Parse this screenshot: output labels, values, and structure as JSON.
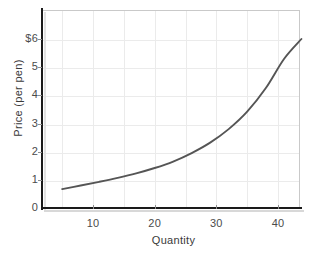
{
  "chart_data": {
    "type": "line",
    "title": "",
    "subtitle": "",
    "xlabel": "Quantity",
    "ylabel": "Price (per pen)",
    "xlim": [
      0,
      46
    ],
    "ylim": [
      0,
      6.6
    ],
    "grid": true,
    "legend": null,
    "legend_position": "none",
    "series": [
      {
        "name": "Supply curve",
        "color": "#555555",
        "x": [
          5,
          8,
          11,
          14,
          17,
          20,
          23,
          26,
          29,
          32,
          35,
          38,
          41,
          43.8
        ],
        "y": [
          0.67,
          0.8,
          0.93,
          1.07,
          1.23,
          1.42,
          1.65,
          1.95,
          2.32,
          2.8,
          3.42,
          4.25,
          5.3,
          6.0
        ]
      }
    ],
    "x_ticks": [
      10,
      20,
      30,
      40
    ],
    "x_tick_labels": [
      "10",
      "20",
      "30",
      "40"
    ],
    "y_ticks": [
      0,
      1,
      2,
      3,
      4,
      5,
      6
    ],
    "y_tick_labels": [
      "0",
      "1",
      "2",
      "3",
      "4",
      "5",
      "$6"
    ],
    "x_gridlines": [
      5,
      10,
      15,
      20,
      25,
      30,
      35,
      40,
      45
    ],
    "y_gridlines": [
      1,
      2,
      3,
      4,
      5,
      6
    ],
    "annotations": []
  },
  "axes": {
    "x_title": "Quantity",
    "y_title": "Price (per pen)"
  },
  "colors": {
    "curve": "#555555",
    "axis": "#1a1a1a",
    "grid": "#ebebeb",
    "tick_text": "#4b4b4b",
    "background": "#ffffff"
  }
}
